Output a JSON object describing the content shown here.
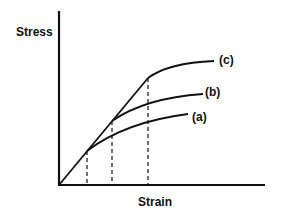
{
  "diagram": {
    "type": "stress-strain curves",
    "y_axis_label": "Stress",
    "x_axis_label": "Strain",
    "colors": {
      "line": "#111111",
      "background": "#ffffff"
    },
    "curves": [
      {
        "id": "a",
        "label": "(a)",
        "yield_point": {
          "x": 87,
          "y": 151
        },
        "end_point": {
          "x": 188,
          "y": 114
        }
      },
      {
        "id": "b",
        "label": "(b)",
        "yield_point": {
          "x": 112,
          "y": 121
        },
        "end_point": {
          "x": 203,
          "y": 94
        }
      },
      {
        "id": "c",
        "label": "(c)",
        "yield_point": {
          "x": 148,
          "y": 78
        },
        "end_point": {
          "x": 214,
          "y": 61
        }
      }
    ],
    "dashed_lines": [
      {
        "from_curve": "a"
      },
      {
        "from_curve": "b"
      },
      {
        "from_curve": "c"
      }
    ]
  }
}
